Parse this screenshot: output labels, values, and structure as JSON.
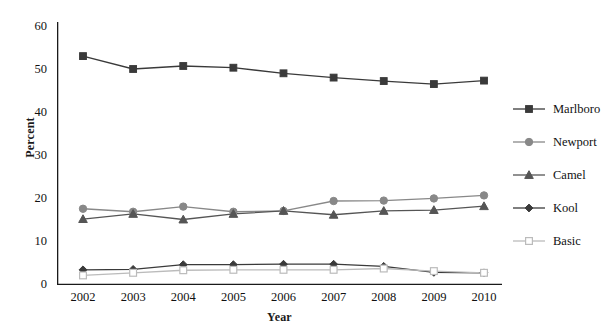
{
  "top_fragment": "Rate",
  "axes": {
    "ylabel": "Percent",
    "xlabel": "Year",
    "yticks": [
      "0",
      "10",
      "20",
      "30",
      "40",
      "50",
      "60"
    ],
    "xticks": [
      "2002",
      "2003",
      "2004",
      "2005",
      "2006",
      "2007",
      "2008",
      "2009",
      "2010"
    ]
  },
  "legend": {
    "items": [
      {
        "label": "Marlboro",
        "marker": "square-filled",
        "color": "#3a3a3a"
      },
      {
        "label": "Newport",
        "marker": "circle-filled",
        "color": "#888888"
      },
      {
        "label": "Camel",
        "marker": "triangle-filled",
        "color": "#555555"
      },
      {
        "label": "Kool",
        "marker": "diamond-filled",
        "color": "#3a3a3a"
      },
      {
        "label": "Basic",
        "marker": "square-open",
        "color": "#bbbbbb"
      }
    ]
  },
  "chart_data": {
    "type": "line",
    "title": "",
    "xlabel": "Year",
    "ylabel": "Percent",
    "x": [
      2002,
      2003,
      2004,
      2005,
      2006,
      2007,
      2008,
      2009,
      2010
    ],
    "categories": [
      "2002",
      "2003",
      "2004",
      "2005",
      "2006",
      "2007",
      "2008",
      "2009",
      "2010"
    ],
    "xlim": [
      2001.6,
      2010.6
    ],
    "ylim": [
      0,
      60
    ],
    "yticks": [
      0,
      10,
      20,
      30,
      40,
      50,
      60
    ],
    "grid": false,
    "legend_position": "right",
    "series": [
      {
        "name": "Marlboro",
        "color": "#3a3a3a",
        "marker": "square-filled",
        "values": [
          53.0,
          50.0,
          50.7,
          50.3,
          49.0,
          48.0,
          47.2,
          46.5,
          47.3
        ]
      },
      {
        "name": "Newport",
        "color": "#888888",
        "marker": "circle-filled",
        "values": [
          17.5,
          16.8,
          18.0,
          16.8,
          17.0,
          19.3,
          19.4,
          19.9,
          20.6
        ]
      },
      {
        "name": "Camel",
        "color": "#555555",
        "marker": "triangle-filled",
        "values": [
          15.1,
          16.3,
          15.0,
          16.3,
          17.0,
          16.1,
          17.0,
          17.2,
          18.1
        ]
      },
      {
        "name": "Kool",
        "color": "#3a3a3a",
        "marker": "diamond-filled",
        "values": [
          3.3,
          3.4,
          4.5,
          4.5,
          4.6,
          4.6,
          4.1,
          2.7,
          2.6
        ]
      },
      {
        "name": "Basic",
        "color": "#bbbbbb",
        "marker": "square-open",
        "values": [
          2.0,
          2.6,
          3.2,
          3.3,
          3.3,
          3.3,
          3.6,
          3.0,
          2.6
        ]
      }
    ]
  }
}
